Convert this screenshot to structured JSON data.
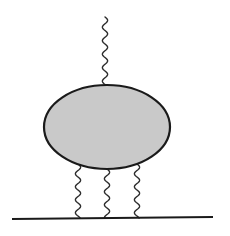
{
  "diagram": {
    "type": "feynman-blob-diagram",
    "colors": {
      "background": "#ffffff",
      "stroke": "#1a1a1a",
      "blob_fill": "#c9c9c9",
      "wave_stroke": "#2a2a2a"
    },
    "blob": {
      "cx": 107,
      "cy": 127,
      "rx": 63,
      "ry": 42,
      "stroke_width": 2.2
    },
    "baseline": {
      "x1": 12,
      "y1": 219,
      "x2": 213,
      "y2": 217,
      "stroke_width": 2.2
    },
    "wavy_lines": [
      {
        "name": "top",
        "x": 105,
        "y1": 17,
        "y2": 86,
        "wavelength": 13.5,
        "amplitude": 2.6
      },
      {
        "name": "bottom-left",
        "x": 78,
        "y1": 164,
        "y2": 218,
        "wavelength": 13,
        "amplitude": 2.6
      },
      {
        "name": "bottom-middle",
        "x": 107,
        "y1": 169,
        "y2": 218,
        "wavelength": 13,
        "amplitude": 2.6
      },
      {
        "name": "bottom-right",
        "x": 137,
        "y1": 164,
        "y2": 218,
        "wavelength": 13,
        "amplitude": 2.6
      }
    ],
    "labels": []
  }
}
